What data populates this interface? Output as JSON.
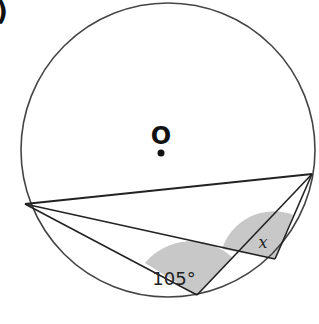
{
  "figure": {
    "corner_mark": ")",
    "center_label": "O",
    "angle_known": "105°",
    "angle_unknown": "x"
  },
  "geometry": {
    "circle": {
      "cx": 168,
      "cy": 150,
      "r": 147
    },
    "center_dot": {
      "x": 160,
      "y": 153
    },
    "points": {
      "A": {
        "x": 25,
        "y": 204
      },
      "B": {
        "x": 312,
        "y": 174
      },
      "C": {
        "x": 197,
        "y": 295
      },
      "D": {
        "x": 275,
        "y": 259
      }
    },
    "segments": [
      [
        "A",
        "B"
      ],
      [
        "A",
        "C"
      ],
      [
        "A",
        "D"
      ],
      [
        "B",
        "C"
      ],
      [
        "B",
        "D"
      ]
    ]
  },
  "colors": {
    "stroke": "#222222",
    "circle_stroke": "#444444",
    "shade": "#c8c8c8",
    "text": "#222222"
  }
}
